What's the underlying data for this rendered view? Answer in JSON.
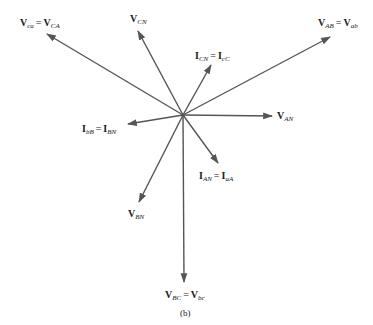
{
  "diagram": {
    "center": [
      183,
      115
    ],
    "stroke_color": "#555555",
    "phasors": [
      {
        "id": "v-ab",
        "tip": [
          330,
          37
        ],
        "label": {
          "left": 318,
          "top": 18,
          "parts": [
            [
              "V",
              "AB"
            ],
            [
              "V",
              "ab"
            ]
          ]
        }
      },
      {
        "id": "v-ca",
        "tip": [
          47,
          34
        ],
        "label": {
          "left": 20,
          "top": 18,
          "parts": [
            [
              "V",
              "ca"
            ],
            [
              "V",
              "CA"
            ]
          ]
        }
      },
      {
        "id": "v-cn",
        "tip": [
          138,
          31
        ],
        "label": {
          "left": 130,
          "top": 15,
          "parts": [
            [
              "V",
              "CN"
            ]
          ]
        }
      },
      {
        "id": "i-cn",
        "tip": [
          211,
          65
        ],
        "label": {
          "left": 195,
          "top": 52,
          "parts": [
            [
              "I",
              "CN"
            ],
            [
              "I",
              "cC"
            ]
          ]
        }
      },
      {
        "id": "v-an",
        "tip": [
          272,
          116
        ],
        "label": {
          "left": 277,
          "top": 112,
          "parts": [
            [
              "V",
              "AN"
            ]
          ]
        }
      },
      {
        "id": "i-bb",
        "tip": [
          128,
          124
        ],
        "label": {
          "left": 82,
          "top": 125,
          "parts": [
            [
              "I",
              "bB"
            ],
            [
              "I",
              "BN"
            ]
          ]
        }
      },
      {
        "id": "i-an",
        "tip": [
          218,
          163
        ],
        "label": {
          "left": 199,
          "top": 172,
          "parts": [
            [
              "I",
              "AN"
            ],
            [
              "I",
              "aA"
            ]
          ]
        }
      },
      {
        "id": "v-bn",
        "tip": [
          139,
          202
        ],
        "label": {
          "left": 128,
          "top": 210,
          "parts": [
            [
              "V",
              "BN"
            ]
          ]
        }
      },
      {
        "id": "v-bc",
        "tip": [
          184,
          282
        ],
        "label": {
          "left": 165,
          "top": 291,
          "parts": [
            [
              "V",
              "BC"
            ],
            [
              "V",
              "bc"
            ]
          ]
        }
      }
    ],
    "labels": {
      "v_ab": {
        "a": "V",
        "a_sub": "AB",
        "eq": "=",
        "b": "V",
        "b_sub": "ab"
      },
      "v_ca": {
        "a": "V",
        "a_sub": "ca",
        "eq": "=",
        "b": "V",
        "b_sub": "CA"
      },
      "v_cn": {
        "a": "V",
        "a_sub": "CN"
      },
      "i_cn": {
        "a": "I",
        "a_sub": "CN",
        "eq": "=",
        "b": "I",
        "b_sub": "cC"
      },
      "v_an": {
        "a": "V",
        "a_sub": "AN"
      },
      "i_bb": {
        "a": "I",
        "a_sub": "bB",
        "eq": "=",
        "b": "I",
        "b_sub": "BN"
      },
      "i_an": {
        "a": "I",
        "a_sub": "AN",
        "eq": "=",
        "b": "I",
        "b_sub": "aA"
      },
      "v_bn": {
        "a": "V",
        "a_sub": "BN"
      },
      "v_bc": {
        "a": "V",
        "a_sub": "BC",
        "eq": "=",
        "b": "V",
        "b_sub": "bc"
      }
    },
    "caption": "(b)"
  }
}
